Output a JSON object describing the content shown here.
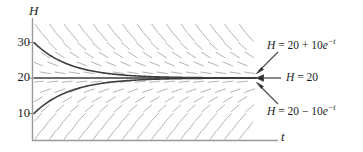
{
  "figure": {
    "type": "slope-field-with-solution-curves",
    "axes": {
      "y_axis_label": "H",
      "x_axis_label": "t",
      "y_ticks": [
        {
          "label": "30",
          "value": 30
        },
        {
          "label": "20",
          "value": 20
        },
        {
          "label": "10",
          "value": 10
        }
      ],
      "x_ticks": [],
      "ylim": [
        0,
        34
      ],
      "xlim": [
        0,
        6.2
      ],
      "grid": false
    },
    "annotations": [
      {
        "id": "top",
        "parts": {
          "lhs": "H",
          "eq": " = ",
          "const": "20",
          "op": " + ",
          "coef": "10",
          "base": "e",
          "exp": "−t"
        },
        "target": "upper-curve"
      },
      {
        "id": "middle",
        "parts": {
          "lhs": "H",
          "eq": " = ",
          "const": "20",
          "op": "",
          "coef": "",
          "base": "",
          "exp": ""
        },
        "target": "equilibrium-line"
      },
      {
        "id": "bottom",
        "parts": {
          "lhs": "H",
          "eq": " = ",
          "const": "20",
          "op": " − ",
          "coef": "10",
          "base": "e",
          "exp": "−t"
        },
        "target": "lower-curve"
      }
    ],
    "colors": {
      "curve": "#3d3d3d",
      "slope_field": "#aab2bd",
      "axis": "#9a9a9a",
      "text": "#1d1d1d",
      "arrow": "#4a4a4a"
    }
  },
  "chart_data": {
    "type": "line",
    "title": "",
    "xlabel": "t",
    "ylabel": "H",
    "xlim": [
      0,
      6.2
    ],
    "ylim": [
      0,
      34
    ],
    "grid": false,
    "legend_position": "right-inline-annotations",
    "xtick_labels": [],
    "ytick_labels": [
      "10",
      "20",
      "30"
    ],
    "ytick_values": [
      10,
      20,
      30
    ],
    "annotations": [
      "H = 20 + 10e^{-t}",
      "H = 20",
      "H = 20 - 10e^{-t}"
    ],
    "series": [
      {
        "name": "H = 20 + 10e^{-t}",
        "formula": "20 + 10*exp(-t)",
        "x": [
          0,
          0.5,
          1,
          1.5,
          2,
          2.5,
          3,
          3.5,
          4,
          4.5,
          5,
          5.5,
          6
        ],
        "values": [
          30,
          26.07,
          23.68,
          22.23,
          21.35,
          20.82,
          20.5,
          20.3,
          20.18,
          20.11,
          20.07,
          20.04,
          20.02
        ]
      },
      {
        "name": "H = 20",
        "formula": "20",
        "x": [
          0,
          0.5,
          1,
          1.5,
          2,
          2.5,
          3,
          3.5,
          4,
          4.5,
          5,
          5.5,
          6
        ],
        "values": [
          20,
          20,
          20,
          20,
          20,
          20,
          20,
          20,
          20,
          20,
          20,
          20,
          20
        ]
      },
      {
        "name": "H = 20 - 10e^{-t}",
        "formula": "20 - 10*exp(-t)",
        "x": [
          0,
          0.5,
          1,
          1.5,
          2,
          2.5,
          3,
          3.5,
          4,
          4.5,
          5,
          5.5,
          6
        ],
        "values": [
          10,
          13.93,
          16.32,
          17.77,
          18.65,
          19.18,
          19.5,
          19.7,
          19.82,
          19.89,
          19.93,
          19.96,
          19.98
        ]
      }
    ],
    "slope_field": {
      "equation": "dH/dt = -(H - 20)",
      "description": "dashes with slope proportional to 20 - H; negative above H=20, positive below, flat at H=20"
    }
  }
}
